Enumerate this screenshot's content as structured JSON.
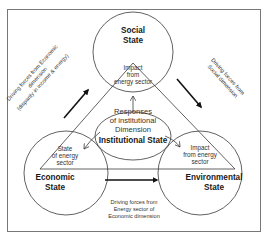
{
  "diagram": {
    "nodes": {
      "social": {
        "title_line1": "Social",
        "title_line2": "State",
        "inner_line1": "Impact",
        "inner_line2": "from",
        "inner_line3": "energy sector"
      },
      "economic": {
        "title_line1": "Economic",
        "title_line2": "State",
        "inner_line1": "State",
        "inner_line2": "of energy",
        "inner_line3": "sector"
      },
      "environmental": {
        "title_line1": "Environmental",
        "title_line2": "State",
        "inner_line1": "Impact",
        "inner_line2": "from energy",
        "inner_line3": "sector"
      },
      "institutional": {
        "line1": "Responses",
        "line2": "of institutional",
        "line3": "Dimension",
        "title": "Institutional State"
      }
    },
    "edges": {
      "economic_to_social": {
        "line1": "Driving forces from Economic",
        "line2": "dimension",
        "line3": "(disparity in income & energy)"
      },
      "social_to_environmental": {
        "line1": "Driving forces from",
        "line2": "Social dimension"
      },
      "economic_to_environmental": {
        "line1": "Driving forces from",
        "line2": "Energy sector of",
        "line3": "Economic dimension"
      }
    },
    "colors": {
      "stroke": "#3a3a3a",
      "text": "#333333",
      "frame": "#777777"
    }
  }
}
